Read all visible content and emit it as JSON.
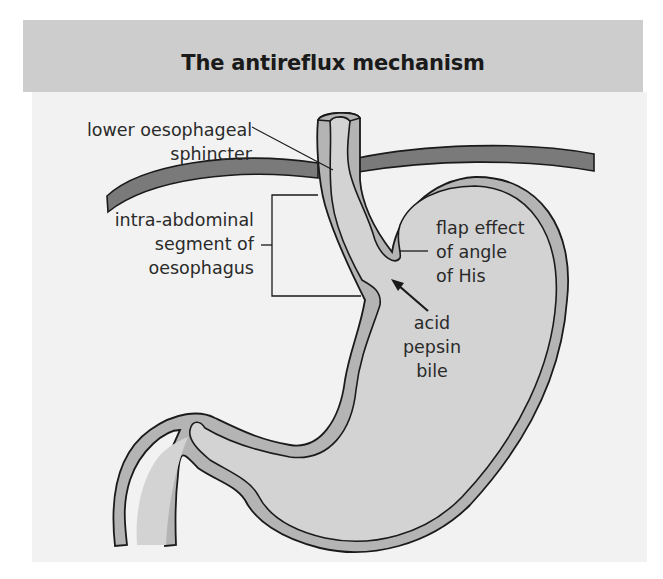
{
  "title": "The antireflux mechanism",
  "labels": {
    "les": [
      "lower oesophageal",
      "sphincter"
    ],
    "intra_abdominal": [
      "intra-abdominal",
      "segment of",
      "oesophagus"
    ],
    "flap": [
      "flap effect",
      "of angle",
      "of His"
    ],
    "contents": [
      "acid",
      "pepsin",
      "bile"
    ]
  },
  "colors": {
    "title_band": "#cdcdcd",
    "panel": "#f2f2f2",
    "diaphragm": "#7a7a7a",
    "wall": "#b4b4b4",
    "lumen": "#d3d3d3",
    "outline": "#1a1a1a"
  }
}
